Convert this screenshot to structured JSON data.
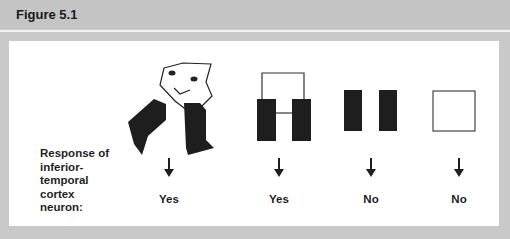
{
  "figure": {
    "title": "Figure 5.1",
    "row_label": "Response of inferior-temporal cortex neuron:",
    "row_label_lines": [
      "Response of",
      "inferior-",
      "temporal",
      "cortex",
      "neuron:"
    ],
    "stimuli": [
      {
        "name": "face-with-hands",
        "response": "Yes"
      },
      {
        "name": "two-bars-connected-with-loop",
        "response": "Yes"
      },
      {
        "name": "two-separate-bars",
        "response": "No"
      },
      {
        "name": "empty-square",
        "response": "No"
      }
    ]
  },
  "colors": {
    "background": "#c9c9c9",
    "panel": "#ffffff",
    "ink": "#1a1a1a"
  }
}
